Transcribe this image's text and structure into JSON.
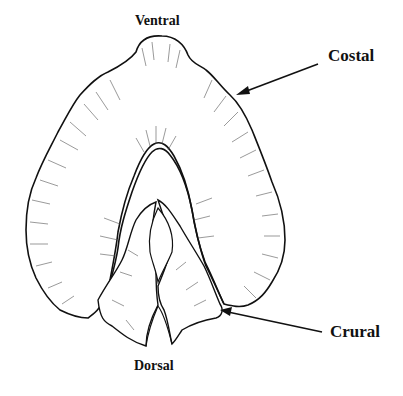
{
  "figure": {
    "labels": {
      "ventral": "Ventral",
      "costal": "Costal",
      "crural": "Crural",
      "dorsal": "Dorsal"
    },
    "colors": {
      "line": "#111111",
      "background": "#ffffff"
    }
  }
}
